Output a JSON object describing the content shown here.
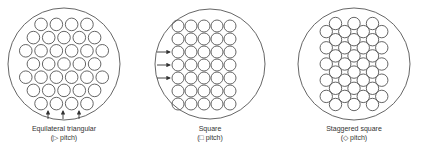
{
  "colors": {
    "stroke": "#555555",
    "background": "#ffffff",
    "text": "#333333"
  },
  "layouts": [
    {
      "id": "triangular",
      "title": "Equilateral triangular",
      "subtitle": "(▷ pitch)",
      "shell": {
        "cx": 64,
        "cy": 64,
        "r": 56
      },
      "tube_rows": [
        4,
        5,
        6,
        5,
        6,
        5,
        4
      ],
      "tube_count": 35,
      "flow_arrows": "up (3 arrows at bottom)"
    },
    {
      "id": "square",
      "title": "Square",
      "subtitle": "(□ pitch)",
      "shell": {
        "cx": 210,
        "cy": 64,
        "r": 55
      },
      "grid": {
        "cols": 5,
        "rows": 7
      },
      "tube_count": 35,
      "flow_arrows": "right (3 arrows at left)"
    },
    {
      "id": "staggered-square",
      "title": "Staggered square",
      "subtitle": "(◇ pitch)",
      "shell": {
        "cx": 354,
        "cy": 64,
        "r": 56
      },
      "tube_rows": [
        3,
        4,
        3,
        4,
        3,
        4,
        3,
        4,
        3,
        4,
        3
      ],
      "tube_count": 38
    }
  ]
}
